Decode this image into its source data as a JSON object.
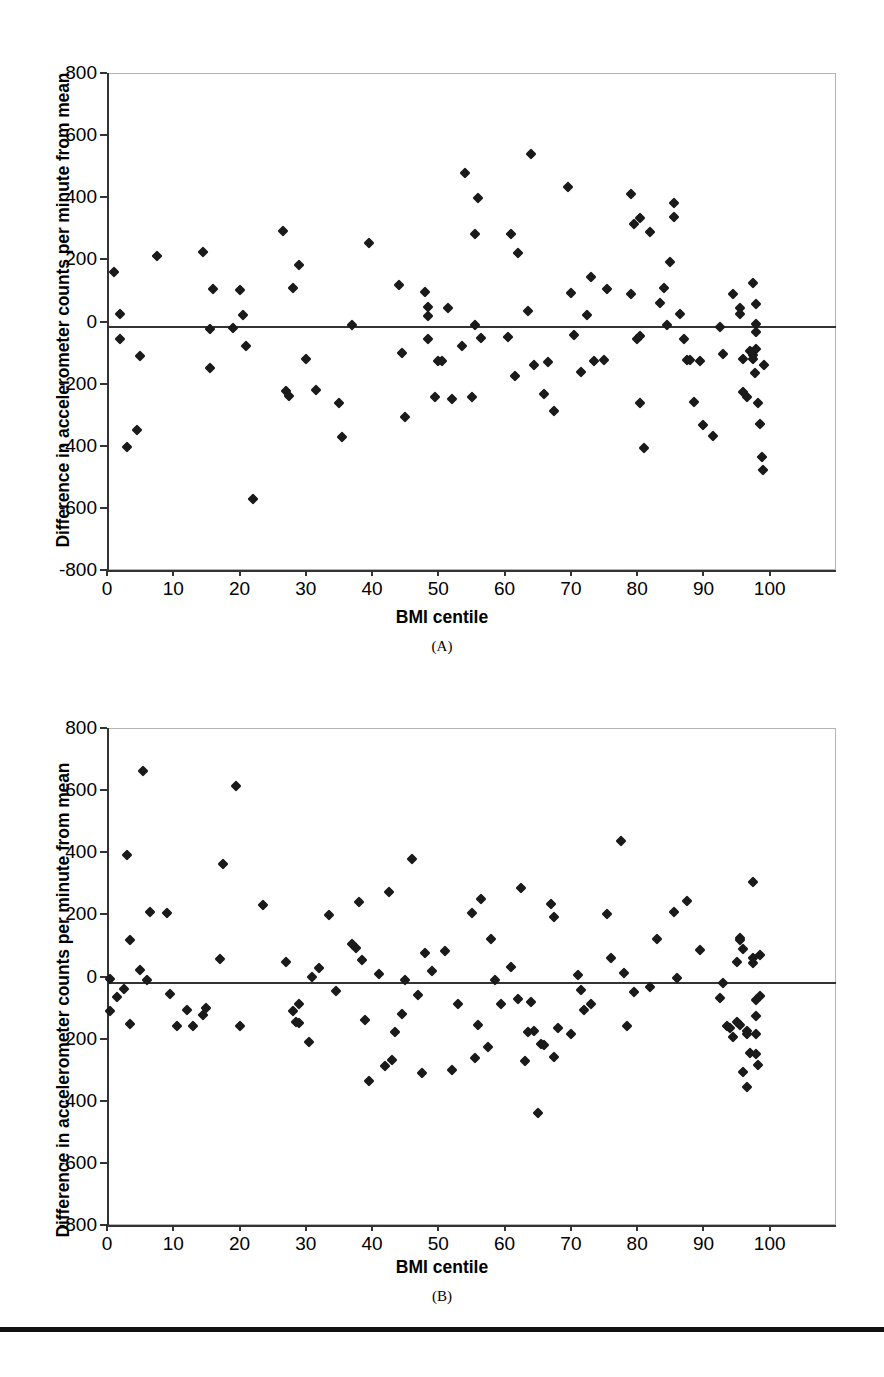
{
  "figure": {
    "background": "#ffffff",
    "axis_color": "#333333",
    "frame_color": "#b4b4b4",
    "marker_color": "#1a1a1a",
    "footer_rule_color": "#111111"
  },
  "panels": [
    {
      "tag": "(A)",
      "xlabel": "BMI centile",
      "ylabel": "Difference in accelerometer counts per minute from mean"
    },
    {
      "tag": "(B)",
      "xlabel": "BMI centile",
      "ylabel": "Difference in accelerometer counts per minute from mean"
    }
  ],
  "chart_data": [
    {
      "type": "scatter",
      "panel": "(A)",
      "title": "",
      "xlabel": "BMI centile",
      "ylabel": "Difference in accelerometer counts per minute from mean",
      "xlim": [
        0,
        110
      ],
      "ylim": [
        -800,
        800
      ],
      "xticks": [
        0,
        10,
        20,
        30,
        40,
        50,
        60,
        70,
        80,
        90,
        100
      ],
      "yticks": [
        -800,
        -600,
        -400,
        -200,
        0,
        200,
        400,
        600,
        800
      ],
      "xticklabels": [
        "0",
        "10",
        "20",
        "30",
        "40",
        "50",
        "60",
        "70",
        "80",
        "90",
        "100"
      ],
      "yticklabels": [
        "-800",
        "-600",
        "-400",
        "-200",
        "0",
        "200",
        "400",
        "600",
        "800"
      ],
      "grid": false,
      "legend": null,
      "reference_line": {
        "orientation": "horizontal",
        "y": -15
      },
      "marker": "diamond",
      "points": [
        [
          1,
          160
        ],
        [
          2,
          25
        ],
        [
          2,
          -55
        ],
        [
          3,
          -405
        ],
        [
          4.5,
          -350
        ],
        [
          5,
          -110
        ],
        [
          7.5,
          210
        ],
        [
          14.5,
          225
        ],
        [
          15.5,
          -25
        ],
        [
          15.5,
          -150
        ],
        [
          16,
          105
        ],
        [
          19,
          -20
        ],
        [
          20,
          100
        ],
        [
          20.5,
          20
        ],
        [
          21,
          -80
        ],
        [
          22,
          -570
        ],
        [
          26.5,
          290
        ],
        [
          27,
          -225
        ],
        [
          27.5,
          -240
        ],
        [
          28,
          108
        ],
        [
          29,
          182
        ],
        [
          30,
          -120
        ],
        [
          31.5,
          -222
        ],
        [
          35,
          -262
        ],
        [
          35.5,
          -372
        ],
        [
          37,
          -12
        ],
        [
          39.5,
          252
        ],
        [
          44,
          118
        ],
        [
          44.5,
          -100
        ],
        [
          45,
          -308
        ],
        [
          48,
          95
        ],
        [
          48.5,
          48
        ],
        [
          48.5,
          18
        ],
        [
          48.5,
          -57
        ],
        [
          49.5,
          -243
        ],
        [
          50,
          -128
        ],
        [
          50.5,
          -128
        ],
        [
          51.5,
          45
        ],
        [
          52,
          -248
        ],
        [
          53.5,
          -80
        ],
        [
          54,
          478
        ],
        [
          55,
          -243
        ],
        [
          55.5,
          -10
        ],
        [
          55.5,
          282
        ],
        [
          56,
          396
        ],
        [
          56.5,
          -52
        ],
        [
          60.5,
          -50
        ],
        [
          61,
          282
        ],
        [
          61.5,
          -175
        ],
        [
          62,
          222
        ],
        [
          63.5,
          35
        ],
        [
          64,
          538
        ],
        [
          64.5,
          -140
        ],
        [
          66,
          -235
        ],
        [
          66.5,
          -130
        ],
        [
          67.5,
          -288
        ],
        [
          69.5,
          432
        ],
        [
          70,
          92
        ],
        [
          70.5,
          -45
        ],
        [
          71.5,
          -162
        ],
        [
          72.5,
          22
        ],
        [
          73,
          143
        ],
        [
          73.5,
          -128
        ],
        [
          75,
          -125
        ],
        [
          75.5,
          105
        ],
        [
          79,
          88
        ],
        [
          79,
          412
        ],
        [
          79.5,
          315
        ],
        [
          80,
          -55
        ],
        [
          80.5,
          -48
        ],
        [
          80.5,
          332
        ],
        [
          80.5,
          -262
        ],
        [
          81,
          -408
        ],
        [
          82,
          288
        ],
        [
          83.5,
          58
        ],
        [
          84,
          108
        ],
        [
          84.5,
          -10
        ],
        [
          85,
          190
        ],
        [
          85.5,
          382
        ],
        [
          85.5,
          335
        ],
        [
          86.5,
          25
        ],
        [
          87,
          -55
        ],
        [
          87.5,
          -125
        ],
        [
          88,
          -125
        ],
        [
          88.5,
          -258
        ],
        [
          89.5,
          -128
        ],
        [
          90,
          -332
        ],
        [
          91.5,
          -370
        ],
        [
          92.5,
          -18
        ],
        [
          93,
          -105
        ],
        [
          94.5,
          88
        ],
        [
          95.5,
          25
        ],
        [
          95.5,
          42
        ],
        [
          96,
          -122
        ],
        [
          96,
          -228
        ],
        [
          96.5,
          -242
        ],
        [
          97,
          -96
        ],
        [
          97.5,
          125
        ],
        [
          97.5,
          -108
        ],
        [
          97.5,
          -120
        ],
        [
          97.8,
          -165
        ],
        [
          98,
          55
        ],
        [
          98,
          -8
        ],
        [
          98,
          -35
        ],
        [
          98,
          -88
        ],
        [
          98.2,
          -262
        ],
        [
          98.5,
          -330
        ],
        [
          98.8,
          -435
        ],
        [
          99,
          -478
        ],
        [
          99.2,
          -140
        ]
      ],
      "n_points": 110
    },
    {
      "type": "scatter",
      "panel": "(B)",
      "title": "",
      "xlabel": "BMI centile",
      "ylabel": "Difference in accelerometer counts per minute from mean",
      "xlim": [
        0,
        110
      ],
      "ylim": [
        -800,
        800
      ],
      "xticks": [
        0,
        10,
        20,
        30,
        40,
        50,
        60,
        70,
        80,
        90,
        100
      ],
      "yticks": [
        -800,
        -600,
        -400,
        -200,
        0,
        200,
        400,
        600,
        800
      ],
      "xticklabels": [
        "0",
        "10",
        "20",
        "30",
        "40",
        "50",
        "60",
        "70",
        "80",
        "90",
        "100"
      ],
      "yticklabels": [
        "-800",
        "-600",
        "-400",
        "-200",
        "0",
        "200",
        "400",
        "600",
        "800"
      ],
      "grid": false,
      "legend": null,
      "reference_line": {
        "orientation": "horizontal",
        "y": -18
      },
      "marker": "diamond",
      "points": [
        [
          0.5,
          -8
        ],
        [
          0.5,
          -112
        ],
        [
          1.5,
          -65
        ],
        [
          2.5,
          -40
        ],
        [
          3,
          392
        ],
        [
          3.5,
          118
        ],
        [
          3.5,
          -152
        ],
        [
          5,
          22
        ],
        [
          5.5,
          660
        ],
        [
          6,
          -10
        ],
        [
          6.5,
          207
        ],
        [
          9,
          203
        ],
        [
          9.5,
          -55
        ],
        [
          10.5,
          -160
        ],
        [
          12,
          -108
        ],
        [
          13,
          -158
        ],
        [
          14.5,
          -125
        ],
        [
          15,
          -100
        ],
        [
          17,
          55
        ],
        [
          17.5,
          362
        ],
        [
          19.5,
          612
        ],
        [
          20,
          -158
        ],
        [
          23.5,
          230
        ],
        [
          27,
          48
        ],
        [
          28,
          -112
        ],
        [
          28.5,
          -148
        ],
        [
          29,
          -150
        ],
        [
          29,
          -88
        ],
        [
          30.5,
          -212
        ],
        [
          31,
          0
        ],
        [
          32,
          28
        ],
        [
          33.5,
          198
        ],
        [
          34.5,
          -48
        ],
        [
          37,
          105
        ],
        [
          37.5,
          92
        ],
        [
          38,
          240
        ],
        [
          38.5,
          52
        ],
        [
          39,
          -140
        ],
        [
          39.5,
          -335
        ],
        [
          41,
          8
        ],
        [
          42,
          -288
        ],
        [
          42.5,
          272
        ],
        [
          43,
          -268
        ],
        [
          43.5,
          -178
        ],
        [
          44.5,
          -120
        ],
        [
          45,
          -10
        ],
        [
          46,
          378
        ],
        [
          47,
          -60
        ],
        [
          47.5,
          -312
        ],
        [
          48,
          75
        ],
        [
          49,
          18
        ],
        [
          51,
          82
        ],
        [
          52,
          -300
        ],
        [
          53,
          -90
        ],
        [
          55,
          205
        ],
        [
          55.5,
          -262
        ],
        [
          56,
          -155
        ],
        [
          56.5,
          248
        ],
        [
          57.5,
          -228
        ],
        [
          58,
          120
        ],
        [
          58.5,
          -12
        ],
        [
          59.5,
          -88
        ],
        [
          61,
          32
        ],
        [
          62,
          -72
        ],
        [
          62.5,
          285
        ],
        [
          63,
          -272
        ],
        [
          63.5,
          -180
        ],
        [
          64,
          -82
        ],
        [
          64.5,
          -175
        ],
        [
          65,
          -438
        ],
        [
          65.5,
          -218
        ],
        [
          66,
          -222
        ],
        [
          67,
          232
        ],
        [
          67.5,
          -258
        ],
        [
          67.5,
          192
        ],
        [
          68,
          -165
        ],
        [
          70,
          -185
        ],
        [
          71,
          5
        ],
        [
          71.5,
          -42
        ],
        [
          72,
          -108
        ],
        [
          73,
          -88
        ],
        [
          75.5,
          202
        ],
        [
          76,
          58
        ],
        [
          77.5,
          435
        ],
        [
          78,
          12
        ],
        [
          78.5,
          -158
        ],
        [
          79.5,
          -50
        ],
        [
          82,
          -35
        ],
        [
          83,
          122
        ],
        [
          85.5,
          208
        ],
        [
          86,
          -5
        ],
        [
          87.5,
          242
        ],
        [
          89.5,
          85
        ],
        [
          92.5,
          -68
        ],
        [
          93,
          -22
        ],
        [
          93.5,
          -158
        ],
        [
          94,
          -165
        ],
        [
          94.5,
          -195
        ],
        [
          95,
          -145
        ],
        [
          95,
          48
        ],
        [
          95.5,
          118
        ],
        [
          95.5,
          125
        ],
        [
          95.5,
          -155
        ],
        [
          96,
          88
        ],
        [
          96,
          -308
        ],
        [
          96.5,
          -175
        ],
        [
          96.5,
          -185
        ],
        [
          96.5,
          -355
        ],
        [
          97,
          -245
        ],
        [
          97.5,
          305
        ],
        [
          97.5,
          42
        ],
        [
          97.5,
          58
        ],
        [
          98,
          -75
        ],
        [
          98,
          -128
        ],
        [
          98,
          -185
        ],
        [
          98,
          -250
        ],
        [
          98.2,
          -285
        ],
        [
          98.5,
          68
        ],
        [
          98.5,
          -62
        ]
      ],
      "n_points": 119
    }
  ]
}
